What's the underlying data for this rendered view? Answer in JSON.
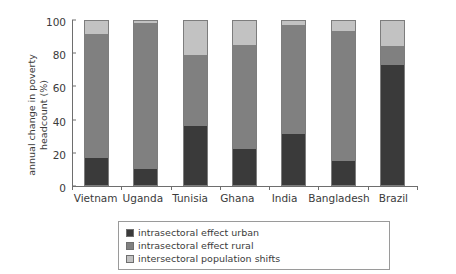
{
  "cut_off_text": {
    "top_fragment": "",
    "bottom_fragment": ""
  },
  "chart_data": {
    "type": "bar",
    "subtype": "stacked-vertical",
    "title": "",
    "xlabel": "",
    "ylabel": "annual change in poverty headcount (%)",
    "ylabel_line1": "annual change in poverty",
    "ylabel_line2": "headcount (%)",
    "categories": [
      "Vietnam",
      "Uganda",
      "Tunisia",
      "Ghana",
      "India",
      "Bangladesh",
      "Brazil"
    ],
    "ylim": [
      0,
      100
    ],
    "yticks": [
      0,
      20,
      40,
      60,
      80,
      100
    ],
    "ytick_labels": [
      "0",
      "20",
      "40",
      "60",
      "80",
      "100"
    ],
    "grid": false,
    "legend_position": "below-center",
    "stack_order": [
      "intrasectoral effect urban",
      "intrasectoral effect rural",
      "intersectoral population shifts"
    ],
    "series": [
      {
        "name": "intrasectoral effect urban",
        "color": "#3a3a3a",
        "values": [
          16.5,
          10.0,
          36.0,
          22.0,
          31.0,
          14.5,
          73.0
        ]
      },
      {
        "name": "intrasectoral effect rural",
        "color": "#808080",
        "values": [
          75.5,
          88.5,
          43.0,
          63.5,
          66.5,
          79.5,
          12.0
        ]
      },
      {
        "name": "intersectoral population shifts",
        "color": "#c2c2c2",
        "values": [
          8.0,
          1.5,
          21.0,
          14.5,
          2.5,
          6.0,
          15.0
        ]
      }
    ]
  },
  "legend": {
    "entries": [
      {
        "label": "intrasectoral effect urban",
        "color": "#3a3a3a"
      },
      {
        "label": "intrasectoral effect rural",
        "color": "#808080"
      },
      {
        "label": "intersectoral population shifts",
        "color": "#c2c2c2"
      }
    ]
  }
}
